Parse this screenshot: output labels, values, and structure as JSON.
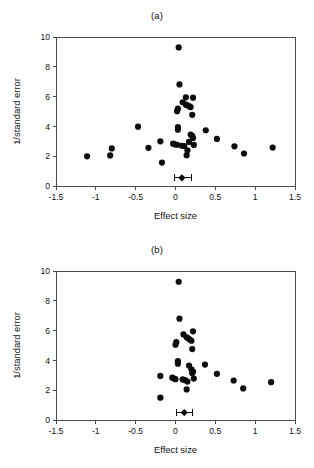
{
  "figure": {
    "panels": [
      {
        "id": "a",
        "label": "(a)",
        "xlabel": "Effect size",
        "ylabel": "1/standard error"
      },
      {
        "id": "b",
        "label": "(b)",
        "xlabel": "Effect size",
        "ylabel": "1/standard error"
      }
    ],
    "caption_partial": ""
  },
  "chart_data": [
    {
      "type": "scatter",
      "title": "(a)",
      "xlabel": "Effect size",
      "ylabel": "1/standard error",
      "xlim": [
        -1.5,
        1.5
      ],
      "ylim": [
        0,
        10
      ],
      "xticks": [
        -1.5,
        -1,
        -0.5,
        0,
        0.5,
        1,
        1.5
      ],
      "xticklabels": [
        "-1.5",
        "-1",
        "-0.5",
        "0",
        "0.5",
        "1",
        "1.5"
      ],
      "yticks": [
        0,
        2,
        4,
        6,
        8,
        10
      ],
      "yticklabels": [
        "0",
        "2",
        "4",
        "6",
        "8",
        "10"
      ],
      "grid": false,
      "legend": false,
      "marker": "filled-circle",
      "marker_color": "#0d0d0d",
      "points": [
        {
          "x": 0.04,
          "y": 9.3
        },
        {
          "x": 0.05,
          "y": 6.82
        },
        {
          "x": 0.13,
          "y": 5.95
        },
        {
          "x": 0.22,
          "y": 5.93
        },
        {
          "x": 0.09,
          "y": 5.62
        },
        {
          "x": 0.13,
          "y": 5.46
        },
        {
          "x": 0.15,
          "y": 5.42
        },
        {
          "x": 0.17,
          "y": 5.36
        },
        {
          "x": 0.19,
          "y": 5.3
        },
        {
          "x": 0.03,
          "y": 5.19
        },
        {
          "x": 0.02,
          "y": 5.02
        },
        {
          "x": 0.21,
          "y": 4.78
        },
        {
          "x": -0.47,
          "y": 3.98
        },
        {
          "x": 0.03,
          "y": 3.96
        },
        {
          "x": 0.03,
          "y": 3.78
        },
        {
          "x": 0.38,
          "y": 3.74
        },
        {
          "x": 0.19,
          "y": 3.45
        },
        {
          "x": 0.21,
          "y": 3.36
        },
        {
          "x": 0.22,
          "y": 3.22
        },
        {
          "x": 0.52,
          "y": 3.16
        },
        {
          "x": -0.19,
          "y": 3.0
        },
        {
          "x": 0.17,
          "y": 2.96
        },
        {
          "x": -0.03,
          "y": 2.84
        },
        {
          "x": -0.01,
          "y": 2.8
        },
        {
          "x": 0.02,
          "y": 2.77
        },
        {
          "x": 0.23,
          "y": 2.76
        },
        {
          "x": 0.08,
          "y": 2.7
        },
        {
          "x": 0.11,
          "y": 2.68
        },
        {
          "x": 0.74,
          "y": 2.66
        },
        {
          "x": -0.34,
          "y": 2.56
        },
        {
          "x": 1.22,
          "y": 2.58
        },
        {
          "x": -0.8,
          "y": 2.52
        },
        {
          "x": 0.15,
          "y": 2.4
        },
        {
          "x": 0.86,
          "y": 2.18
        },
        {
          "x": 0.14,
          "y": 2.07
        },
        {
          "x": -0.82,
          "y": 2.05
        },
        {
          "x": -1.11,
          "y": 1.99
        },
        {
          "x": -0.17,
          "y": 1.57
        }
      ],
      "summary": {
        "x": 0.08,
        "y": 0.55,
        "ci_low": -0.01,
        "ci_high": 0.2,
        "marker": "diamond-with-whiskers"
      }
    },
    {
      "type": "scatter",
      "title": "(b)",
      "xlabel": "Effect size",
      "ylabel": "1/standard error",
      "xlim": [
        -1.5,
        1.5
      ],
      "ylim": [
        0,
        10
      ],
      "xticks": [
        -1.5,
        -1,
        -0.5,
        0,
        0.5,
        1,
        1.5
      ],
      "xticklabels": [
        "-1.5",
        "-1",
        "-0.5",
        "0",
        "0.5",
        "1",
        "1.5"
      ],
      "yticks": [
        0,
        2,
        4,
        6,
        8,
        10
      ],
      "yticklabels": [
        "0",
        "2",
        "4",
        "6",
        "8",
        "10"
      ],
      "grid": false,
      "legend": false,
      "marker": "filled-circle",
      "marker_color": "#0d0d0d",
      "points": [
        {
          "x": 0.04,
          "y": 9.28
        },
        {
          "x": 0.05,
          "y": 6.8
        },
        {
          "x": 0.22,
          "y": 5.95
        },
        {
          "x": 0.1,
          "y": 5.74
        },
        {
          "x": 0.14,
          "y": 5.55
        },
        {
          "x": 0.16,
          "y": 5.48
        },
        {
          "x": 0.18,
          "y": 5.4
        },
        {
          "x": 0.2,
          "y": 5.32
        },
        {
          "x": 0.01,
          "y": 5.22
        },
        {
          "x": 0.0,
          "y": 5.05
        },
        {
          "x": 0.21,
          "y": 4.76
        },
        {
          "x": 0.03,
          "y": 3.95
        },
        {
          "x": 0.03,
          "y": 3.78
        },
        {
          "x": 0.37,
          "y": 3.72
        },
        {
          "x": 0.17,
          "y": 3.65
        },
        {
          "x": 0.2,
          "y": 3.4
        },
        {
          "x": 0.22,
          "y": 3.25
        },
        {
          "x": 0.21,
          "y": 3.14
        },
        {
          "x": 0.52,
          "y": 3.1
        },
        {
          "x": -0.19,
          "y": 2.96
        },
        {
          "x": -0.04,
          "y": 2.84
        },
        {
          "x": -0.02,
          "y": 2.78
        },
        {
          "x": 0.0,
          "y": 2.74
        },
        {
          "x": 0.09,
          "y": 2.72
        },
        {
          "x": 0.12,
          "y": 2.68
        },
        {
          "x": 0.23,
          "y": 2.78
        },
        {
          "x": 0.73,
          "y": 2.65
        },
        {
          "x": 1.2,
          "y": 2.54
        },
        {
          "x": 0.15,
          "y": 2.58
        },
        {
          "x": 0.85,
          "y": 2.12
        },
        {
          "x": 0.14,
          "y": 2.05
        },
        {
          "x": -0.19,
          "y": 1.5
        }
      ],
      "summary": {
        "x": 0.11,
        "y": 0.5,
        "ci_low": 0.01,
        "ci_high": 0.21,
        "marker": "diamond-with-whiskers"
      }
    }
  ]
}
